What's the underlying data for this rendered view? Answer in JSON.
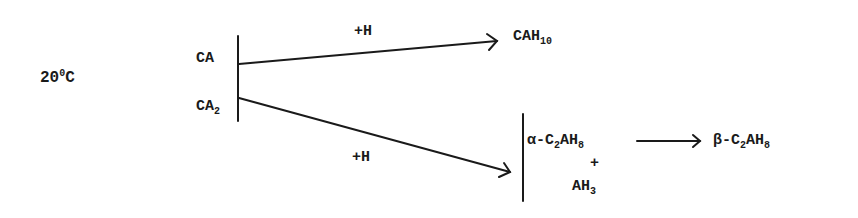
{
  "temperature": {
    "value": "20",
    "degree": "0",
    "unit": "C"
  },
  "reactants": [
    {
      "base": "CA",
      "sub": ""
    },
    {
      "base": "CA",
      "sub": "2"
    }
  ],
  "reactions": [
    {
      "reagent": "+H",
      "product": {
        "base": "CAH",
        "sub": "10"
      }
    },
    {
      "reagent": "+H"
    }
  ],
  "products_group": {
    "first": {
      "prefix": "α-C",
      "sub1": "2",
      "mid": "AH",
      "sub2": "8"
    },
    "plus": "+",
    "second": {
      "base": "AH",
      "sub": "3"
    }
  },
  "conversion": {
    "prefix": "β-C",
    "sub1": "2",
    "mid": "AH",
    "sub2": "8"
  }
}
